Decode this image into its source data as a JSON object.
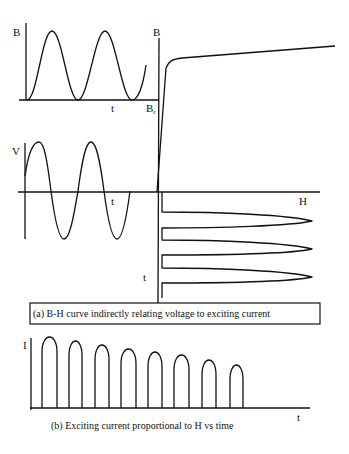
{
  "figure": {
    "panel_a": {
      "caption": "(a)  B-H curve indirectly relating voltage to exciting current",
      "flux_vs_time": {
        "y_label": "B",
        "x_label": "t"
      },
      "bh_curve": {
        "y_label": "B",
        "x_label": "H",
        "remanence_label_main": "B",
        "remanence_label_sub": "r"
      },
      "voltage_vs_time": {
        "y_label": "V",
        "x_label": "t"
      },
      "h_vs_time": {
        "time_axis_label": "t",
        "pulse_count": 3
      }
    },
    "panel_b": {
      "caption": "(b)  Exciting current proportional to H  vs time",
      "y_label": "I",
      "x_label": "t",
      "pulse_count": 8,
      "relative_pulse_heights": [
        1.0,
        0.94,
        0.89,
        0.83,
        0.79,
        0.75,
        0.68,
        0.61
      ]
    }
  }
}
